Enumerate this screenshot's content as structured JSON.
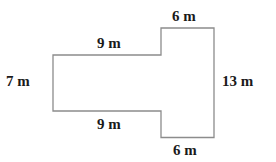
{
  "figure": {
    "type": "composite-rectilinear-shape",
    "stroke_color": "#8c8c8c",
    "text_color": "#1a1a1a",
    "background": "#ffffff",
    "labels": {
      "top_right": "6 m",
      "top_left": "9 m",
      "left": "7 m",
      "right": "13 m",
      "bottom_left": "9 m",
      "bottom_right": "6 m"
    },
    "dimensions": {
      "left_section_width_m": 9,
      "left_section_height_m": 7,
      "right_section_width_m": 6,
      "right_section_height_m": 13,
      "unit": "m"
    }
  }
}
